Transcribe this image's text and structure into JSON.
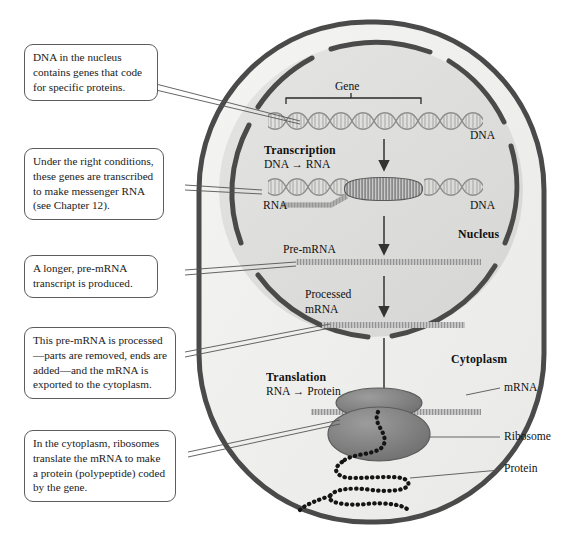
{
  "figure": {
    "colors": {
      "page_background": "#ffffff",
      "cell_membrane": "#4a4a4a",
      "cytoplasm_fill": "#f0f0ee",
      "nucleus_fill": "#e0e0de",
      "nuclear_envelope": "#4a4a4a",
      "rna_strand": "#9a9a9a",
      "ribosome": "#808080",
      "protein_beads": "#1a1a1a",
      "callout_border": "#5c5c5c",
      "leader_line": "#555555",
      "arrow": "#333333"
    }
  },
  "callouts": [
    {
      "id": "callout-dna-nucleus",
      "text": "DNA in the nucleus contains genes that code for specific proteins."
    },
    {
      "id": "callout-transcription",
      "text": "Under the right conditions, these genes are transcribed to make messenger RNA (see Chapter 12)."
    },
    {
      "id": "callout-pre-mrna",
      "text": "A longer, pre-mRNA transcript is produced."
    },
    {
      "id": "callout-processing",
      "text": "This pre-mRNA is processed—parts are removed, ends are added—and the mRNA is exported to the cytoplasm."
    },
    {
      "id": "callout-translation",
      "text": "In the cytoplasm, ribosomes translate the mRNA to make a protein (polypeptide) coded by the gene."
    }
  ],
  "diagram_labels": {
    "gene": "Gene",
    "dna_top": "DNA",
    "dna_bottom": "DNA",
    "transcription_heading": "Transcription",
    "transcription_equation": "DNA → RNA",
    "rna": "RNA",
    "nucleus": "Nucleus",
    "cytoplasm": "Cytoplasm",
    "pre_mrna": "Pre-mRNA",
    "processed_mrna_line1": "Processed",
    "processed_mrna_line2": "mRNA",
    "translation_heading": "Translation",
    "translation_equation": "RNA → Protein",
    "mrna": "mRNA",
    "ribosome": "Ribosome",
    "protein": "Protein"
  }
}
